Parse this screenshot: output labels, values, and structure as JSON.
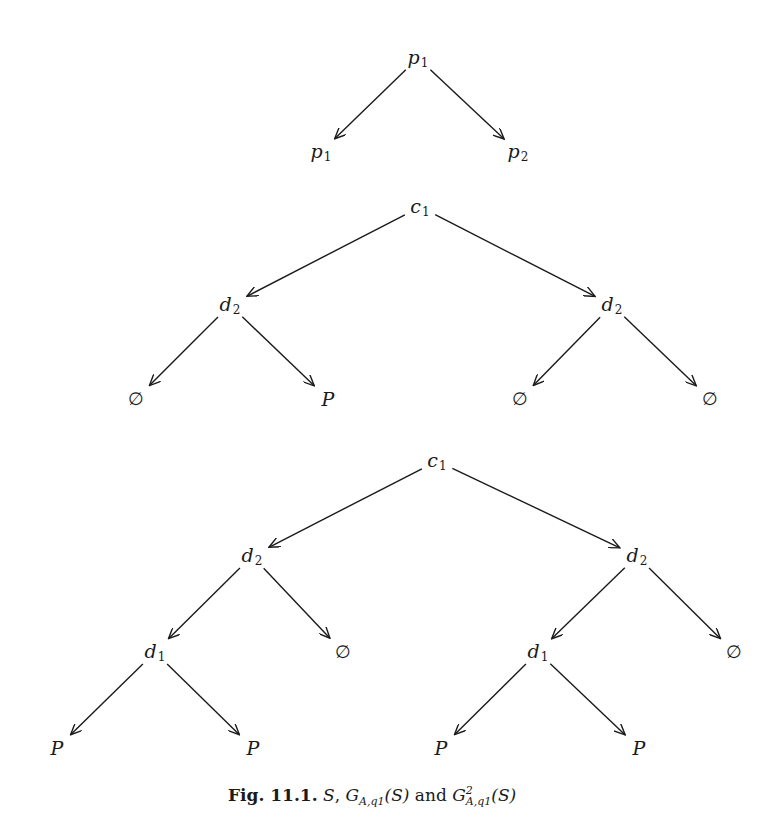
{
  "figure": {
    "caption_label": "Fig. 11.1.",
    "caption_text": "S, G_{A,q1}(S) and G^2_{A,q1}(S)",
    "caption_parts": {
      "s1": "S",
      "sep1": ", ",
      "g1": "G",
      "g1_sub": "A,q1",
      "g1_arg": "(S)",
      "and": " and ",
      "g2": "G",
      "g2_sup": "2",
      "g2_sub": "A,q1",
      "g2_arg": "(S)"
    }
  },
  "trees": [
    {
      "name": "S",
      "nodes": [
        {
          "id": "t1n0",
          "base": "p",
          "sub": "1",
          "x": 418,
          "y": 58
        },
        {
          "id": "t1n1",
          "base": "p",
          "sub": "1",
          "x": 321,
          "y": 152
        },
        {
          "id": "t1n2",
          "base": "p",
          "sub": "2",
          "x": 518,
          "y": 152
        }
      ],
      "edges": [
        [
          "t1n0",
          "t1n1"
        ],
        [
          "t1n0",
          "t1n2"
        ]
      ]
    },
    {
      "name": "G_{A,q1}(S)",
      "nodes": [
        {
          "id": "t2n0",
          "base": "c",
          "sub": "1",
          "x": 420,
          "y": 207
        },
        {
          "id": "t2n1",
          "base": "d",
          "sub": "2",
          "x": 230,
          "y": 305
        },
        {
          "id": "t2n2",
          "base": "d",
          "sub": "2",
          "x": 612,
          "y": 305
        },
        {
          "id": "t2n3",
          "base": "∅",
          "sub": "",
          "x": 136,
          "y": 399
        },
        {
          "id": "t2n4",
          "base": "P",
          "sub": "",
          "x": 328,
          "y": 399
        },
        {
          "id": "t2n5",
          "base": "∅",
          "sub": "",
          "x": 520,
          "y": 399
        },
        {
          "id": "t2n6",
          "base": "∅",
          "sub": "",
          "x": 710,
          "y": 399
        }
      ],
      "edges": [
        [
          "t2n0",
          "t2n1"
        ],
        [
          "t2n0",
          "t2n2"
        ],
        [
          "t2n1",
          "t2n3"
        ],
        [
          "t2n1",
          "t2n4"
        ],
        [
          "t2n2",
          "t2n5"
        ],
        [
          "t2n2",
          "t2n6"
        ]
      ]
    },
    {
      "name": "G^2_{A,q1}(S)",
      "nodes": [
        {
          "id": "t3n0",
          "base": "c",
          "sub": "1",
          "x": 437,
          "y": 461
        },
        {
          "id": "t3n1",
          "base": "d",
          "sub": "2",
          "x": 252,
          "y": 556
        },
        {
          "id": "t3n2",
          "base": "d",
          "sub": "2",
          "x": 637,
          "y": 556
        },
        {
          "id": "t3n3",
          "base": "d",
          "sub": "1",
          "x": 155,
          "y": 652
        },
        {
          "id": "t3n4",
          "base": "∅",
          "sub": "",
          "x": 343,
          "y": 652
        },
        {
          "id": "t3n5",
          "base": "d",
          "sub": "1",
          "x": 538,
          "y": 652
        },
        {
          "id": "t3n6",
          "base": "∅",
          "sub": "",
          "x": 734,
          "y": 652
        },
        {
          "id": "t3n7",
          "base": "P",
          "sub": "",
          "x": 57,
          "y": 748
        },
        {
          "id": "t3n8",
          "base": "P",
          "sub": "",
          "x": 253,
          "y": 748
        },
        {
          "id": "t3n9",
          "base": "P",
          "sub": "",
          "x": 441,
          "y": 748
        },
        {
          "id": "t3n10",
          "base": "P",
          "sub": "",
          "x": 639,
          "y": 748
        }
      ],
      "edges": [
        [
          "t3n0",
          "t3n1"
        ],
        [
          "t3n0",
          "t3n2"
        ],
        [
          "t3n1",
          "t3n3"
        ],
        [
          "t3n1",
          "t3n4"
        ],
        [
          "t3n2",
          "t3n5"
        ],
        [
          "t3n2",
          "t3n6"
        ],
        [
          "t3n3",
          "t3n7"
        ],
        [
          "t3n3",
          "t3n8"
        ],
        [
          "t3n5",
          "t3n9"
        ],
        [
          "t3n5",
          "t3n10"
        ]
      ]
    }
  ],
  "colors": {
    "ink": "#1a1a1a",
    "background": "#ffffff"
  }
}
